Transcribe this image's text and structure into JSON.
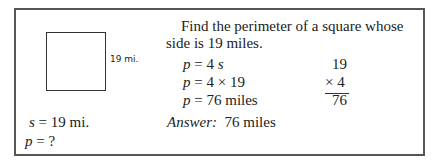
{
  "figure": {
    "side_label": "19 mi.",
    "given": [
      {
        "var": "s",
        "rest": " = 19 mi."
      },
      {
        "var": "p",
        "rest": " = ?"
      }
    ]
  },
  "problem": {
    "line1": "Find the perimeter of a square whose",
    "line2": "side is 19 miles.",
    "steps": [
      {
        "var": "p",
        "rest": " = 4 ",
        "tail_italic": "s"
      },
      {
        "var": "p",
        "rest": " = 4 × 19",
        "tail_italic": ""
      },
      {
        "var": "p",
        "rest": " = 76 miles",
        "tail_italic": ""
      }
    ],
    "answer_label": "Answer:",
    "answer_value": "76 miles"
  },
  "calculation": {
    "top": "19",
    "multiplier": "× 4",
    "result": "76"
  }
}
